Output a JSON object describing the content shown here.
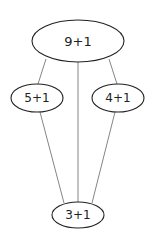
{
  "diagram": {
    "type": "directed-graph",
    "nodes": [
      {
        "id": "top",
        "label": "9+1",
        "cx": 78,
        "cy": 41,
        "rx": 46,
        "ry": 21,
        "font_size": 13
      },
      {
        "id": "left",
        "label": "5+1",
        "cx": 37,
        "cy": 98,
        "rx": 26,
        "ry": 14,
        "font_size": 12
      },
      {
        "id": "right",
        "label": "4+1",
        "cx": 118,
        "cy": 98,
        "rx": 26,
        "ry": 14,
        "font_size": 12
      },
      {
        "id": "bottom",
        "label": "3+1",
        "cx": 78,
        "cy": 215,
        "rx": 26,
        "ry": 13,
        "font_size": 12
      }
    ],
    "edges": [
      {
        "from": "top",
        "to": "left"
      },
      {
        "from": "top",
        "to": "bottom"
      },
      {
        "from": "top",
        "to": "right"
      },
      {
        "from": "left",
        "to": "bottom"
      },
      {
        "from": "right",
        "to": "bottom"
      }
    ],
    "colors": {
      "stroke": "#222222",
      "edge": "#555555",
      "background": "#ffffff"
    }
  }
}
